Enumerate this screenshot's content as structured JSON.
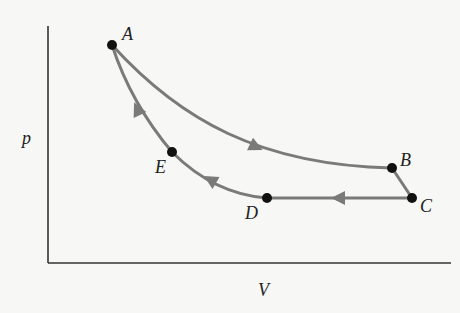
{
  "diagram": {
    "type": "pV-cycle",
    "axes": {
      "y_label": "p",
      "x_label": "V"
    },
    "points": [
      {
        "id": "A",
        "label": "A",
        "x": 112,
        "y": 45
      },
      {
        "id": "B",
        "label": "B",
        "x": 392,
        "y": 168
      },
      {
        "id": "C",
        "label": "C",
        "x": 412,
        "y": 198
      },
      {
        "id": "D",
        "label": "D",
        "x": 267,
        "y": 198
      },
      {
        "id": "E",
        "label": "E",
        "x": 172,
        "y": 152
      }
    ],
    "path_order": [
      "A",
      "B",
      "C",
      "D",
      "E",
      "A"
    ],
    "colors": {
      "curve": "#7a7a7a",
      "point": "#111111",
      "axis": "#333333"
    }
  }
}
